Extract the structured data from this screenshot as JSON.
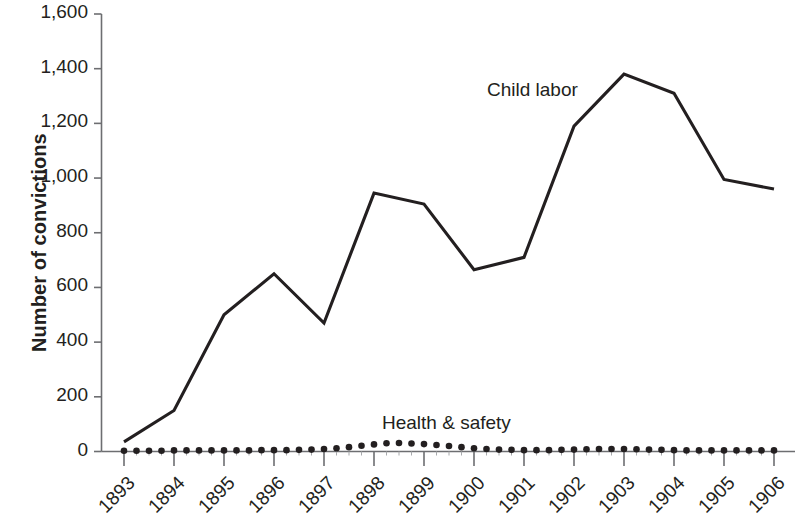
{
  "chart_data": {
    "type": "line",
    "title": "",
    "xlabel": "",
    "ylabel": "Number of convictions",
    "x": [
      1893,
      1894,
      1895,
      1896,
      1897,
      1898,
      1899,
      1900,
      1901,
      1902,
      1903,
      1904,
      1905,
      1906
    ],
    "categories": [
      "1893",
      "1894",
      "1895",
      "1896",
      "1897",
      "1898",
      "1899",
      "1900",
      "1901",
      "1902",
      "1903",
      "1904",
      "1905",
      "1906"
    ],
    "xlim": [
      1893,
      1906
    ],
    "ylim": [
      0,
      1600
    ],
    "yticks": [
      0,
      200,
      400,
      600,
      800,
      1000,
      1200,
      1400,
      1600
    ],
    "ytick_labels": [
      "0",
      "200",
      "400",
      "600",
      "800",
      "1,000",
      "1,200",
      "1,400",
      "1,600"
    ],
    "grid": false,
    "legend": "inline-annotations",
    "series": [
      {
        "name": "Child labor",
        "style": "line",
        "color": "#231f20",
        "values": [
          35,
          150,
          500,
          650,
          470,
          945,
          905,
          665,
          710,
          1190,
          1380,
          1310,
          995,
          960
        ]
      },
      {
        "name": "Health & safety",
        "style": "dots",
        "color": "#231f20",
        "x_quarterly": [
          1893.0,
          1893.25,
          1893.5,
          1893.75,
          1894.0,
          1894.25,
          1894.5,
          1894.75,
          1895.0,
          1895.25,
          1895.5,
          1895.75,
          1896.0,
          1896.25,
          1896.5,
          1896.75,
          1897.0,
          1897.25,
          1897.5,
          1897.75,
          1898.0,
          1898.25,
          1898.5,
          1898.75,
          1899.0,
          1899.25,
          1899.5,
          1899.75,
          1900.0,
          1900.25,
          1900.5,
          1900.75,
          1901.0,
          1901.25,
          1901.5,
          1901.75,
          1902.0,
          1902.25,
          1902.5,
          1902.75,
          1903.0,
          1903.25,
          1903.5,
          1903.75,
          1904.0,
          1904.25,
          1904.5,
          1904.75,
          1905.0,
          1905.25,
          1905.5,
          1905.75,
          1906.0
        ],
        "values_quarterly": [
          3,
          3,
          3,
          3,
          4,
          4,
          4,
          4,
          4,
          4,
          4,
          5,
          5,
          5,
          6,
          7,
          9,
          12,
          16,
          21,
          26,
          30,
          31,
          29,
          27,
          24,
          20,
          16,
          12,
          9,
          7,
          6,
          5,
          5,
          5,
          6,
          7,
          8,
          9,
          9,
          9,
          8,
          7,
          6,
          5,
          4,
          4,
          4,
          4,
          4,
          4,
          4,
          4
        ]
      }
    ],
    "annotations": [
      {
        "text": "Child labor",
        "series": "Child labor"
      },
      {
        "text": "Health & safety",
        "series": "Health & safety"
      }
    ]
  },
  "axis": {
    "y_title": "Number of convictions"
  },
  "labels": {
    "child_labor": "Child labor",
    "health_safety": "Health & safety"
  },
  "colors": {
    "line": "#231f20",
    "axis": "#6d6e71",
    "background": "#ffffff"
  }
}
